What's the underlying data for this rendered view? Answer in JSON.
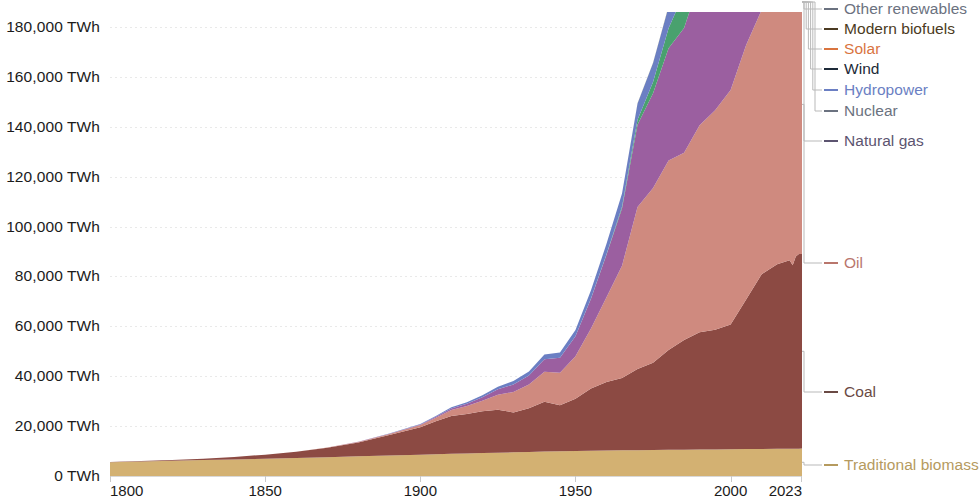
{
  "chart_data": {
    "type": "area",
    "stacked": true,
    "title": "",
    "subtitle": "",
    "xlabel": "",
    "ylabel": "",
    "unit": "TWh",
    "grid": true,
    "legend_position": "right-leader-lines",
    "xlim": [
      1800,
      2023
    ],
    "ylim": [
      0,
      186000
    ],
    "y_ticks": [
      0,
      20000,
      40000,
      60000,
      80000,
      100000,
      120000,
      140000,
      160000,
      180000
    ],
    "y_tick_labels": [
      "0 TWh",
      "20,000 TWh",
      "40,000 TWh",
      "60,000 TWh",
      "80,000 TWh",
      "100,000 TWh",
      "120,000 TWh",
      "140,000 TWh",
      "160,000 TWh",
      "180,000 TWh"
    ],
    "x_ticks": [
      1800,
      1850,
      1900,
      1950,
      2000,
      2023
    ],
    "x_tick_labels": [
      "1800",
      "1850",
      "1900",
      "1950",
      "2000",
      "2023"
    ],
    "x": [
      1800,
      1810,
      1820,
      1830,
      1840,
      1850,
      1860,
      1870,
      1880,
      1890,
      1900,
      1905,
      1910,
      1915,
      1920,
      1925,
      1930,
      1935,
      1940,
      1945,
      1950,
      1955,
      1960,
      1965,
      1970,
      1975,
      1980,
      1985,
      1990,
      1995,
      2000,
      2005,
      2010,
      2015,
      2019,
      2020,
      2021,
      2022,
      2023
    ],
    "series": [
      {
        "name": "Traditional biomass",
        "color": "#d3b172",
        "values": [
          5556,
          5830,
          6100,
          6380,
          6660,
          6950,
          7250,
          7550,
          7870,
          8200,
          8530,
          8700,
          8870,
          9040,
          9200,
          9360,
          9500,
          9640,
          9780,
          9900,
          10000,
          10100,
          10200,
          10280,
          10350,
          10420,
          10480,
          10540,
          10600,
          10660,
          10720,
          10780,
          10840,
          10900,
          10950,
          10950,
          10960,
          10970,
          10980
        ]
      },
      {
        "name": "Coal",
        "color": "#8c4a43",
        "values": [
          97,
          180,
          320,
          560,
          960,
          1600,
          2500,
          3800,
          5600,
          8200,
          11000,
          13200,
          15200,
          15800,
          16800,
          17200,
          16000,
          17500,
          20000,
          18500,
          21000,
          25000,
          27500,
          29000,
          32500,
          35000,
          40000,
          44000,
          47000,
          48000,
          50000,
          60000,
          70000,
          74000,
          75500,
          73500,
          77000,
          78000,
          78000
        ]
      },
      {
        "name": "Oil",
        "color": "#cf8a7f",
        "values": [
          0,
          0,
          0,
          0,
          0,
          0,
          10,
          60,
          180,
          420,
          900,
          1500,
          2400,
          3200,
          4200,
          6000,
          8200,
          9500,
          12000,
          13000,
          17000,
          24000,
          34000,
          45000,
          65000,
          70000,
          76000,
          75000,
          83000,
          88000,
          94000,
          102000,
          106000,
          112000,
          118000,
          110000,
          115000,
          118000,
          120000
        ]
      },
      {
        "name": "Natural gas",
        "color": "#9b5fa0",
        "values": [
          0,
          0,
          0,
          0,
          0,
          0,
          0,
          10,
          40,
          100,
          250,
          400,
          600,
          900,
          1400,
          2200,
          3000,
          3600,
          5000,
          6000,
          8000,
          12000,
          17000,
          23000,
          33000,
          38000,
          45000,
          50000,
          58000,
          63000,
          70000,
          78000,
          86000,
          92000,
          100000,
          98000,
          102000,
          101000,
          103000
        ]
      },
      {
        "name": "Nuclear",
        "color": "#49a16e",
        "values": [
          0,
          0,
          0,
          0,
          0,
          0,
          0,
          0,
          0,
          0,
          0,
          0,
          0,
          0,
          0,
          0,
          0,
          0,
          0,
          0,
          0,
          30,
          200,
          700,
          2000,
          4500,
          8000,
          14000,
          18500,
          21000,
          23000,
          24500,
          24000,
          23000,
          24500,
          23500,
          25000,
          24000,
          24500
        ]
      },
      {
        "name": "Hydropower",
        "color": "#6b7fc3",
        "values": [
          0,
          0,
          0,
          0,
          0,
          0,
          0,
          0,
          30,
          80,
          180,
          300,
          450,
          600,
          800,
          1050,
          1350,
          1600,
          1950,
          2100,
          2500,
          3300,
          4200,
          5300,
          6500,
          7600,
          8600,
          9800,
          11000,
          12000,
          13000,
          14200,
          15800,
          17100,
          18200,
          18500,
          18800,
          19000,
          19300
        ]
      },
      {
        "name": "Wind",
        "color": "#1d2a38",
        "values": [
          0,
          0,
          0,
          0,
          0,
          0,
          0,
          0,
          0,
          0,
          0,
          0,
          0,
          0,
          0,
          0,
          0,
          0,
          0,
          0,
          0,
          0,
          0,
          0,
          0,
          0,
          0,
          20,
          100,
          250,
          800,
          2000,
          4200,
          9500,
          14800,
          16500,
          19000,
          21000,
          23000
        ]
      },
      {
        "name": "Solar",
        "color": "#e27a4a",
        "values": [
          0,
          0,
          0,
          0,
          0,
          0,
          0,
          0,
          0,
          0,
          0,
          0,
          0,
          0,
          0,
          0,
          0,
          0,
          0,
          0,
          0,
          0,
          0,
          0,
          0,
          0,
          0,
          0,
          5,
          15,
          40,
          150,
          900,
          4000,
          9500,
          11500,
          14500,
          17500,
          20000
        ]
      },
      {
        "name": "Modern biofuels",
        "color": "#7a5c33",
        "values": [
          0,
          0,
          0,
          0,
          0,
          0,
          0,
          0,
          0,
          0,
          0,
          0,
          0,
          0,
          0,
          0,
          0,
          0,
          0,
          0,
          0,
          0,
          0,
          0,
          0,
          0,
          60,
          150,
          300,
          420,
          650,
          1000,
          1600,
          2100,
          2500,
          2400,
          2600,
          2700,
          2800
        ]
      },
      {
        "name": "Other renewables",
        "color": "#a39b3d",
        "values": [
          0,
          0,
          0,
          0,
          0,
          0,
          0,
          0,
          0,
          0,
          0,
          0,
          0,
          0,
          0,
          0,
          0,
          0,
          0,
          0,
          0,
          0,
          0,
          0,
          50,
          90,
          150,
          260,
          420,
          620,
          900,
          1300,
          1900,
          2600,
          3400,
          3600,
          3900,
          4100,
          4300
        ]
      }
    ]
  },
  "legend": {
    "items": [
      {
        "label": "Other renewables",
        "color": "#6b7280",
        "series_color": "#a39b3d",
        "y": 9
      },
      {
        "label": "Modern biofuels",
        "color": "#4b3a22",
        "series_color": "#7a5c33",
        "y": 29
      },
      {
        "label": "Solar",
        "color": "#d9743f",
        "series_color": "#e27a4a",
        "y": 49
      },
      {
        "label": "Wind",
        "color": "#1d2a38",
        "series_color": "#1d2a38",
        "y": 69
      },
      {
        "label": "Hydropower",
        "color": "#6b7fc3",
        "series_color": "#6b7fc3",
        "y": 90
      },
      {
        "label": "Nuclear",
        "color": "#6b7280",
        "series_color": "#49a16e",
        "y": 111
      },
      {
        "label": "Natural gas",
        "color": "#5c5470",
        "series_color": "#9b5fa0",
        "y": 141
      },
      {
        "label": "Oil",
        "color": "#b9766c",
        "series_color": "#cf8a7f",
        "y": 263
      },
      {
        "label": "Coal",
        "color": "#6a4a44",
        "series_color": "#8c4a43",
        "y": 392
      },
      {
        "label": "Traditional biomass",
        "color": "#b59a5e",
        "series_color": "#d3b172",
        "y": 465
      }
    ]
  },
  "axes": {
    "y_label_color": "#1b1b1b",
    "x_label_color": "#1b1b1b",
    "gridline_color": "#e9e9e9"
  }
}
